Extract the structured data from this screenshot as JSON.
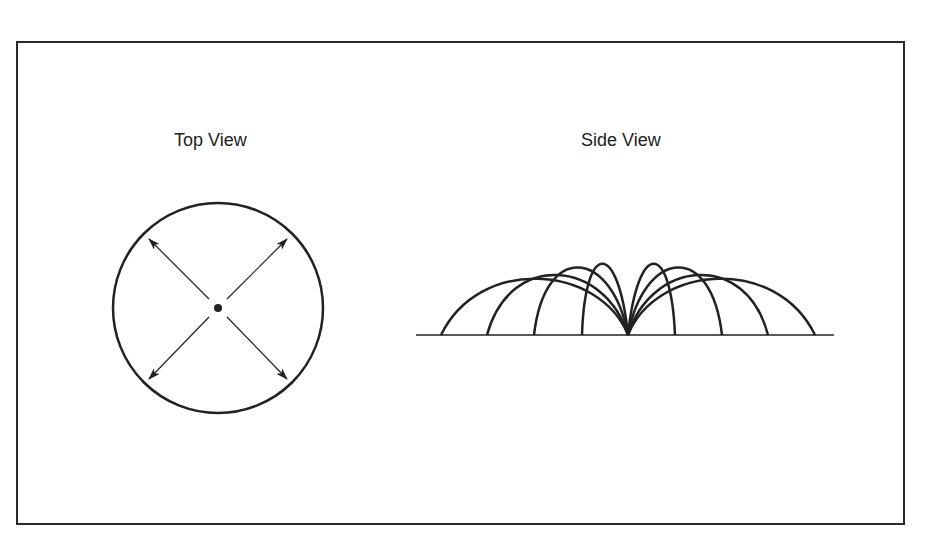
{
  "diagram": {
    "top_view": {
      "title": "Top View",
      "shape": "circle",
      "center_marker": "dot",
      "arrows": [
        "up-left",
        "up-right",
        "down-left",
        "down-right"
      ]
    },
    "side_view": {
      "title": "Side View",
      "baseline": "ground-line",
      "arcs_left": 4,
      "arcs_right": 4,
      "origin": "single point at center of baseline"
    },
    "colors": {
      "stroke": "#222222",
      "background": "#ffffff"
    }
  }
}
